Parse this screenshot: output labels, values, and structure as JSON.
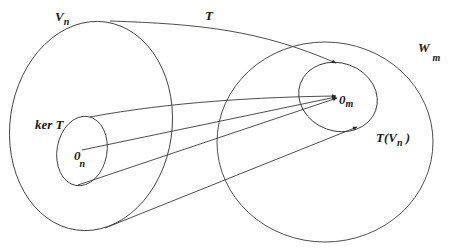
{
  "diagram": {
    "sets": [
      {
        "id": "V",
        "label": "V",
        "subscript": "n",
        "role": "domain"
      },
      {
        "id": "kerT",
        "label": "ker T",
        "role": "kernel"
      },
      {
        "id": "W",
        "label": "W",
        "subscript": "m",
        "role": "codomain"
      },
      {
        "id": "TV",
        "label": "T(V",
        "subscript": "n",
        "suffix": " )",
        "role": "image"
      }
    ],
    "points": [
      {
        "id": "0n",
        "label": "0",
        "subscript": "n"
      },
      {
        "id": "0m",
        "label": "0",
        "subscript": "m"
      }
    ],
    "map_label": "T",
    "arrows": [
      {
        "from": "V top",
        "to": "T(V_n) top"
      },
      {
        "from": "ker T top",
        "to": "0_m"
      },
      {
        "from": "0_n",
        "to": "0_m"
      },
      {
        "from": "ker T bottom",
        "to": "0_m"
      },
      {
        "from": "V bottom",
        "to": "T(V_n) bottom"
      }
    ]
  }
}
